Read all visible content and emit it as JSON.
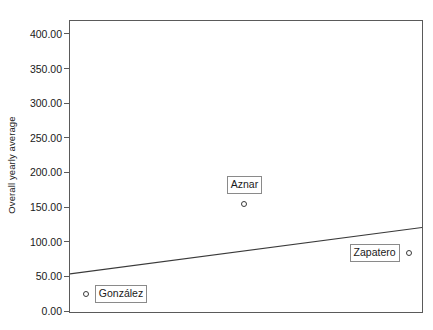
{
  "chart_data": {
    "type": "scatter",
    "title": "",
    "subtitle": "",
    "xlabel": "",
    "ylabel": "Overall yearly average",
    "ylim": [
      0,
      420
    ],
    "xlim": [
      0,
      1
    ],
    "grid": false,
    "legend": "none",
    "y_ticks": [
      {
        "value": 400,
        "label": "400.00"
      },
      {
        "value": 350,
        "label": "350.00"
      },
      {
        "value": 300,
        "label": "300.00"
      },
      {
        "value": 250,
        "label": "250.00"
      },
      {
        "value": 200,
        "label": "200.00"
      },
      {
        "value": 150,
        "label": "150.00"
      },
      {
        "value": 100,
        "label": "100.00"
      },
      {
        "value": 50,
        "label": "50.00"
      },
      {
        "value": 0,
        "label": "0.00"
      }
    ],
    "x_ticks": [],
    "points": [
      {
        "label": "González",
        "x": 0.045,
        "y": 26,
        "label_side": "right"
      },
      {
        "label": "Aznar",
        "x": 0.495,
        "y": 156,
        "label_side": "above"
      },
      {
        "label": "Zapatero",
        "x": 0.962,
        "y": 85,
        "label_side": "left"
      }
    ],
    "fit_line": {
      "name": "linear fit",
      "y_start": 55,
      "y_end": 122,
      "x_start": 0,
      "x_end": 1
    },
    "annotations": []
  },
  "colors": {
    "axis": "#5a5a5a",
    "frame": "#5a5a5a",
    "marker_stroke": "#3a3a3a",
    "fit_line": "#3a3a3a",
    "label_border": "#8a8a8a",
    "text": "#1a1a1a",
    "background": "#ffffff"
  }
}
